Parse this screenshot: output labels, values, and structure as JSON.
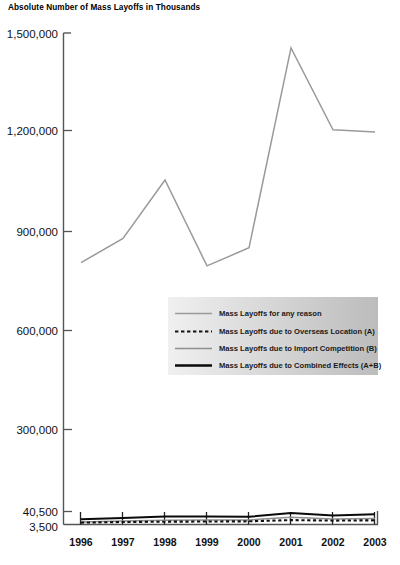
{
  "chart_data": {
    "type": "line",
    "title": "Absolute Number of Mass Layoffs in Thousands",
    "xlabel": "",
    "ylabel": "",
    "grid": false,
    "legend_position": "center-right",
    "axis_note": "y-axis is broken: 3,500 baseline then 40,500, then linear 300,000 steps to 1,500,000",
    "categories": [
      "1996",
      "1997",
      "1998",
      "1999",
      "2000",
      "2001",
      "2002",
      "2003"
    ],
    "yticks": [
      "3,500",
      "40,500",
      "300,000",
      "600,000",
      "900,000",
      "1,200,000",
      "1,500,000"
    ],
    "ytick_values": [
      3500,
      40500,
      300000,
      600000,
      900000,
      1200000,
      1500000
    ],
    "ylim": [
      3500,
      1500000
    ],
    "series": [
      {
        "name": "Mass Layoffs for any reason",
        "style": "solid-gray",
        "color": "#9a9a9a",
        "values": [
          805000,
          878000,
          1055000,
          795000,
          850000,
          1455000,
          1207000,
          1200000
        ]
      },
      {
        "name": "Mass Layoffs due to Overseas Location (A)",
        "style": "dashed-black",
        "color": "#111111",
        "values": [
          9000,
          10500,
          11500,
          12000,
          12500,
          16000,
          14500,
          15500
        ]
      },
      {
        "name": "Mass Layoffs due to Import Competition (B)",
        "style": "solid-gray-thin",
        "color": "#8f8f8f",
        "values": [
          11000,
          13500,
          15500,
          16000,
          16500,
          24000,
          19500,
          21000
        ]
      },
      {
        "name": "Mass Layoffs due to Combined Effects (A+B)",
        "style": "solid-black",
        "color": "#0a0a0a",
        "values": [
          18500,
          22000,
          26000,
          26500,
          25500,
          36500,
          29500,
          32500
        ]
      }
    ]
  },
  "legend": {
    "entries": [
      {
        "label": "Mass Layoffs for any reason"
      },
      {
        "label": "Mass Layoffs due to Overseas Location (A)"
      },
      {
        "label": "Mass Layoffs due to Import Competition (B)"
      },
      {
        "label": "Mass Layoffs due to Combined Effects (A+B)"
      }
    ]
  }
}
